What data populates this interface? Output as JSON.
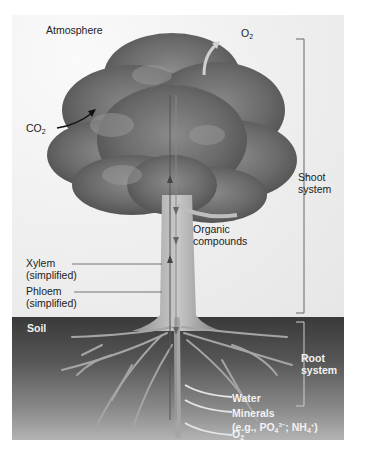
{
  "figure": {
    "regions": {
      "atmosphere": "Atmosphere",
      "soil": "Soil"
    },
    "gases": {
      "co2_base": "CO",
      "co2_sub": "2",
      "o2_top_base": "O",
      "o2_top_sub": "2",
      "o2_root_base": "O",
      "o2_root_sub": "2"
    },
    "brackets": {
      "shoot_line1": "Shoot",
      "shoot_line2": "system",
      "root_line1": "Root",
      "root_line2": "system"
    },
    "labels": {
      "organic_line1": "Organic",
      "organic_line2": "compounds",
      "xylem_line1": "Xylem",
      "xylem_line2": "(simplified)",
      "phloem_line1": "Phloem",
      "phloem_line2": "(simplified)",
      "water": "Water",
      "minerals_line1": "Minerals",
      "minerals_eg": "(e.g., PO",
      "minerals_po_sub": "4",
      "minerals_po_sup": "3−",
      "minerals_sep": "; NH",
      "minerals_nh_sub": "4",
      "minerals_nh_sup": "+",
      "minerals_close": ")"
    },
    "colors": {
      "sky": "#f0f0f0",
      "canopy": "#6b6b6b",
      "soil_top": "#3a3a3a",
      "soil_bottom": "#b3b3b3",
      "bracket": "#666666"
    }
  }
}
